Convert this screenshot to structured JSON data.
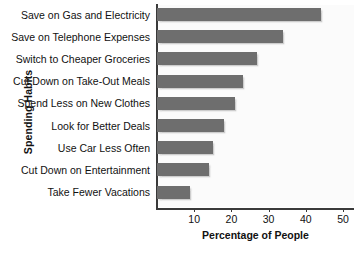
{
  "chart_data": {
    "type": "bar",
    "orientation": "horizontal",
    "title": "",
    "xlabel": "Percentage of People",
    "ylabel": "Spending Habits",
    "categories": [
      "Save on Gas and Electricity",
      "Save on Telephone Expenses",
      "Switch to Cheaper Groceries",
      "Cut Down on Take-Out Meals",
      "Spend Less on New Clothes",
      "Look for Better Deals",
      "Use Car Less Often",
      "Cut Down on Entertainment",
      "Take Fewer Vacations"
    ],
    "values": [
      44,
      34,
      27,
      23,
      21,
      18,
      15,
      14,
      9
    ],
    "xlim": [
      0,
      53
    ],
    "xticks": [
      10,
      20,
      30,
      40,
      50
    ],
    "xtick_labels": [
      "10",
      "20",
      "30",
      "40",
      "50"
    ],
    "grid": false,
    "legend": false,
    "bar_color": "#6e6e6e",
    "axis_color": "#3a3a3a",
    "plot_background": "#fbfbfb",
    "page_background": "#ffffff"
  }
}
